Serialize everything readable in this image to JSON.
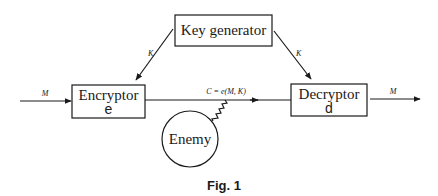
{
  "diagram": {
    "nodes": {
      "key_generator": {
        "label": "Key generator"
      },
      "encryptor": {
        "label": "Encryptor",
        "symbol": "e"
      },
      "decryptor": {
        "label": "Decryptor",
        "symbol": "d"
      },
      "enemy": {
        "label": "Enemy"
      }
    },
    "edges": {
      "keygen_to_encryptor": {
        "label": "K"
      },
      "keygen_to_decryptor": {
        "label": "K"
      },
      "input_message": {
        "label": "M"
      },
      "ciphertext": {
        "label": "C = e(M, K)"
      },
      "output_message": {
        "label": "M"
      },
      "enemy_tap": {
        "label": ""
      }
    },
    "caption": "Fig. 1"
  },
  "colors": {
    "ink": "#1a1a1a",
    "background": "#ffffff"
  }
}
